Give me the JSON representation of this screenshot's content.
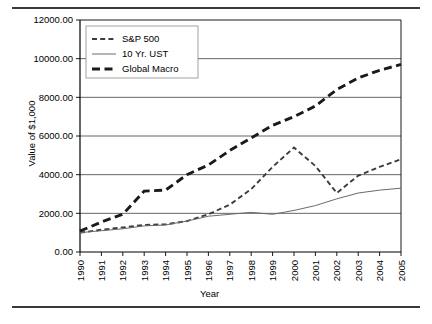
{
  "chart_data": {
    "type": "line",
    "title": "",
    "xlabel": "Year",
    "ylabel": "Value of $1,000",
    "x": [
      1990,
      1991,
      1992,
      1993,
      1994,
      1995,
      1996,
      1997,
      1998,
      1999,
      2000,
      2001,
      2002,
      2003,
      2004,
      2005
    ],
    "xtick_labels": [
      "1990",
      "1991",
      "1992",
      "1993",
      "1994",
      "1995",
      "1996",
      "1997",
      "1998",
      "1999",
      "2000",
      "2001",
      "2002",
      "2003",
      "2004",
      "2005"
    ],
    "ytick_labels": [
      "0.00",
      "2000.00",
      "4000.00",
      "6000.00",
      "8000.00",
      "10000.00",
      "12000.00"
    ],
    "ytick_values": [
      0,
      2000,
      4000,
      6000,
      8000,
      10000,
      12000
    ],
    "ylim": [
      0,
      12000
    ],
    "xlim": [
      1990,
      2005
    ],
    "grid": "horizontal",
    "legend_position": "upper-left-inside",
    "series": [
      {
        "name": "S&P 500",
        "style": "dashed",
        "values": [
          1000,
          1150,
          1270,
          1400,
          1430,
          1600,
          1950,
          2450,
          3250,
          4400,
          5400,
          4450,
          3050,
          3950,
          4400,
          4800
        ]
      },
      {
        "name": "10 Yr. UST",
        "style": "thin-solid",
        "values": [
          1000,
          1100,
          1200,
          1350,
          1400,
          1600,
          1850,
          1950,
          2050,
          1950,
          2150,
          2400,
          2750,
          3050,
          3200,
          3300
        ]
      },
      {
        "name": "Global Macro",
        "style": "thick-dashed",
        "values": [
          1080,
          1550,
          1950,
          3150,
          3200,
          4000,
          4500,
          5250,
          5900,
          6550,
          7000,
          7550,
          8400,
          9000,
          9400,
          9700
        ]
      }
    ]
  },
  "legend": {
    "items": [
      {
        "label": "S&P 500",
        "swatch": "dashed-line-swatch"
      },
      {
        "label": "10 Yr. UST",
        "swatch": "thin-line-swatch"
      },
      {
        "label": "Global Macro",
        "swatch": "thick-dashed-line-swatch"
      }
    ]
  },
  "colors": {
    "axis": "#000000",
    "grid": "#555555",
    "series_sp500": "#3c3c3c",
    "series_ust": "#6a6a6a",
    "series_global_macro": "#1a1a1a",
    "rule": "#3a3a3a"
  }
}
